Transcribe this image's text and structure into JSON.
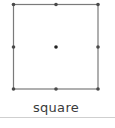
{
  "shape": {
    "name": "square",
    "stroke_color": "#7a7a7a",
    "handle_color": "#4a4a4a",
    "center_color": "#222222",
    "bounds": {
      "x1": 13,
      "y1": 4,
      "x2": 98,
      "y2": 89
    },
    "handles": [
      "top-left",
      "top-center",
      "top-right",
      "middle-left",
      "middle-right",
      "bottom-left",
      "bottom-center",
      "bottom-right"
    ],
    "center_point": true
  },
  "caption": {
    "label": "square"
  }
}
